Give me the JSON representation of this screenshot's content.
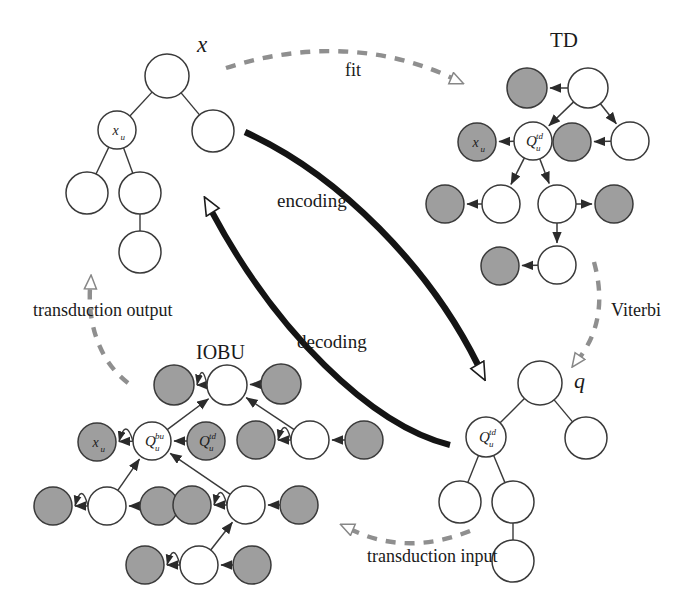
{
  "figure": {
    "background": "#ffffff",
    "ink": "#262626",
    "node_white_fill": "#ffffff",
    "node_gray_fill": "#9e9e9e",
    "node_stroke": "#3a3a3a",
    "dashed_color": "#8f8f8f",
    "thick_arrow_color": "#141414"
  },
  "labels": {
    "x_tree": "x",
    "td_title": "TD",
    "iobu_title": "IOBU",
    "q_tree": "q",
    "fit": "fit",
    "viterbi": "Viterbi",
    "encoding": "encoding",
    "decoding": "decoding",
    "transduction_output": "transduction output",
    "transduction_input": "transduction input"
  },
  "nodes": {
    "x_u": {
      "base": "x",
      "sub": "u",
      "sup": ""
    },
    "q_td": {
      "base": "Q",
      "sub": "u",
      "sup": "td"
    },
    "q_bu": {
      "base": "Q",
      "sub": "u",
      "sup": "bu"
    },
    "q_td_gray": {
      "base": "Q",
      "sub": "u",
      "sup": "td"
    },
    "q_td_tree": {
      "base": "Q",
      "sub": "u",
      "sup": "td"
    }
  },
  "trees": {
    "x": {
      "name": "input tree x",
      "nodes": [
        {
          "id": "x-root",
          "cx": 167,
          "cy": 76,
          "r": 22,
          "fill": "white",
          "label": ""
        },
        {
          "id": "x-u",
          "cx": 117,
          "cy": 130,
          "r": 19,
          "fill": "white",
          "label": "x_u"
        },
        {
          "id": "x-r",
          "cx": 213,
          "cy": 131,
          "r": 21,
          "fill": "white",
          "label": ""
        },
        {
          "id": "x-ll",
          "cx": 87,
          "cy": 193,
          "r": 21,
          "fill": "white",
          "label": ""
        },
        {
          "id": "x-lr",
          "cx": 140,
          "cy": 193,
          "r": 21,
          "fill": "white",
          "label": ""
        },
        {
          "id": "x-llr",
          "cx": 140,
          "cy": 252,
          "r": 21,
          "fill": "white",
          "label": ""
        }
      ],
      "edges": [
        [
          "x-root",
          "x-u"
        ],
        [
          "x-root",
          "x-r"
        ],
        [
          "x-u",
          "x-ll"
        ],
        [
          "x-u",
          "x-lr"
        ],
        [
          "x-lr",
          "x-llr"
        ]
      ]
    },
    "q": {
      "name": "state tree q",
      "nodes": [
        {
          "id": "q-root",
          "cx": 540,
          "cy": 383,
          "r": 22,
          "fill": "white",
          "label": ""
        },
        {
          "id": "q-u",
          "cx": 486,
          "cy": 437,
          "r": 20,
          "fill": "white",
          "label": "Q_u^td"
        },
        {
          "id": "q-r",
          "cx": 586,
          "cy": 438,
          "r": 21,
          "fill": "white",
          "label": ""
        },
        {
          "id": "q-ll",
          "cx": 460,
          "cy": 502,
          "r": 21,
          "fill": "white",
          "label": ""
        },
        {
          "id": "q-lr",
          "cx": 513,
          "cy": 502,
          "r": 21,
          "fill": "white",
          "label": ""
        },
        {
          "id": "q-llr",
          "cx": 513,
          "cy": 561,
          "r": 21,
          "fill": "white",
          "label": ""
        }
      ],
      "edges": [
        [
          "q-root",
          "q-u"
        ],
        [
          "q-root",
          "q-r"
        ],
        [
          "q-u",
          "q-ll"
        ],
        [
          "q-u",
          "q-lr"
        ],
        [
          "q-lr",
          "q-llr"
        ]
      ]
    }
  },
  "td_graph": {
    "name": "top-down hidden Markov tree model",
    "nodes": [
      {
        "id": "td-root",
        "cx": 588,
        "cy": 88,
        "r": 20,
        "fill": "white",
        "label": ""
      },
      {
        "id": "td-root-out",
        "cx": 527,
        "cy": 88,
        "r": 20,
        "fill": "gray",
        "label": ""
      },
      {
        "id": "td-qu",
        "cx": 533,
        "cy": 141,
        "r": 19,
        "fill": "white",
        "label": "Q_u^td"
      },
      {
        "id": "td-xu",
        "cx": 477,
        "cy": 142,
        "r": 19,
        "fill": "gray",
        "label": "x_u"
      },
      {
        "id": "td-r",
        "cx": 630,
        "cy": 141,
        "r": 19,
        "fill": "white",
        "label": ""
      },
      {
        "id": "td-r-out",
        "cx": 572,
        "cy": 142,
        "r": 19,
        "fill": "gray",
        "label": ""
      },
      {
        "id": "td-ll",
        "cx": 501,
        "cy": 204,
        "r": 19,
        "fill": "white",
        "label": ""
      },
      {
        "id": "td-ll-out",
        "cx": 445,
        "cy": 204,
        "r": 19,
        "fill": "gray",
        "label": ""
      },
      {
        "id": "td-lr",
        "cx": 557,
        "cy": 204,
        "r": 19,
        "fill": "white",
        "label": ""
      },
      {
        "id": "td-lr-out",
        "cx": 614,
        "cy": 204,
        "r": 19,
        "fill": "gray",
        "label": ""
      },
      {
        "id": "td-llr",
        "cx": 557,
        "cy": 265,
        "r": 19,
        "fill": "white",
        "label": ""
      },
      {
        "id": "td-llr-out",
        "cx": 500,
        "cy": 266,
        "r": 19,
        "fill": "gray",
        "label": ""
      }
    ],
    "edges": [
      {
        "from": "td-root",
        "to": "td-root-out",
        "kind": "arrow"
      },
      {
        "from": "td-root",
        "to": "td-qu",
        "kind": "arrow"
      },
      {
        "from": "td-root",
        "to": "td-r",
        "kind": "arrow"
      },
      {
        "from": "td-qu",
        "to": "td-xu",
        "kind": "arrow"
      },
      {
        "from": "td-r",
        "to": "td-r-out",
        "kind": "arrow"
      },
      {
        "from": "td-qu",
        "to": "td-ll",
        "kind": "arrow"
      },
      {
        "from": "td-qu",
        "to": "td-lr",
        "kind": "arrow"
      },
      {
        "from": "td-ll",
        "to": "td-ll-out",
        "kind": "arrow"
      },
      {
        "from": "td-lr",
        "to": "td-lr-out",
        "kind": "arrow"
      },
      {
        "from": "td-lr",
        "to": "td-llr",
        "kind": "arrow"
      },
      {
        "from": "td-llr",
        "to": "td-llr-out",
        "kind": "arrow"
      }
    ]
  },
  "iobu_graph": {
    "name": "input-output bottom-up model",
    "nodes": [
      {
        "id": "bu-root",
        "cx": 227,
        "cy": 385,
        "r": 20,
        "fill": "white",
        "label": ""
      },
      {
        "id": "bu-root-l",
        "cx": 174,
        "cy": 385,
        "r": 20,
        "fill": "gray",
        "label": ""
      },
      {
        "id": "bu-root-r",
        "cx": 281,
        "cy": 384,
        "r": 20,
        "fill": "gray",
        "label": ""
      },
      {
        "id": "bu-qbu",
        "cx": 152,
        "cy": 441,
        "r": 19,
        "fill": "white",
        "label": "Q_u^bu"
      },
      {
        "id": "bu-xu",
        "cx": 97,
        "cy": 442,
        "r": 19,
        "fill": "gray",
        "label": "x_u"
      },
      {
        "id": "bu-qtd",
        "cx": 206,
        "cy": 441,
        "r": 19,
        "fill": "gray",
        "label": "Q_u^td"
      },
      {
        "id": "bu-r",
        "cx": 310,
        "cy": 440,
        "r": 19,
        "fill": "white",
        "label": ""
      },
      {
        "id": "bu-r-l",
        "cx": 256,
        "cy": 440,
        "r": 19,
        "fill": "gray",
        "label": ""
      },
      {
        "id": "bu-r-r",
        "cx": 364,
        "cy": 440,
        "r": 19,
        "fill": "gray",
        "label": ""
      },
      {
        "id": "bu-ll",
        "cx": 107,
        "cy": 506,
        "r": 19,
        "fill": "white",
        "label": ""
      },
      {
        "id": "bu-ll-l",
        "cx": 53,
        "cy": 506,
        "r": 19,
        "fill": "gray",
        "label": ""
      },
      {
        "id": "bu-ll-r",
        "cx": 159,
        "cy": 506,
        "r": 19,
        "fill": "gray",
        "label": ""
      },
      {
        "id": "bu-lr",
        "cx": 246,
        "cy": 505,
        "r": 19,
        "fill": "white",
        "label": ""
      },
      {
        "id": "bu-lr-l",
        "cx": 192,
        "cy": 505,
        "r": 19,
        "fill": "gray",
        "label": ""
      },
      {
        "id": "bu-lr-r",
        "cx": 299,
        "cy": 505,
        "r": 19,
        "fill": "gray",
        "label": ""
      },
      {
        "id": "bu-b",
        "cx": 199,
        "cy": 565,
        "r": 19,
        "fill": "white",
        "label": ""
      },
      {
        "id": "bu-b-l",
        "cx": 145,
        "cy": 565,
        "r": 19,
        "fill": "gray",
        "label": ""
      },
      {
        "id": "bu-b-r",
        "cx": 252,
        "cy": 565,
        "r": 19,
        "fill": "gray",
        "label": ""
      }
    ],
    "edges": [
      {
        "from": "bu-root-r",
        "to": "bu-root",
        "kind": "arrow"
      },
      {
        "from": "bu-root",
        "to": "bu-root-l",
        "kind": "arrow"
      },
      {
        "from": "bu-root",
        "to": "bu-root-l",
        "kind": "curve"
      },
      {
        "from": "bu-qtd",
        "to": "bu-qbu",
        "kind": "arrow"
      },
      {
        "from": "bu-qbu",
        "to": "bu-xu",
        "kind": "arrow"
      },
      {
        "from": "bu-qbu",
        "to": "bu-xu",
        "kind": "curve"
      },
      {
        "from": "bu-qbu",
        "to": "bu-root",
        "kind": "arrow"
      },
      {
        "from": "bu-r",
        "to": "bu-root",
        "kind": "arrow"
      },
      {
        "from": "bu-r-r",
        "to": "bu-r",
        "kind": "arrow"
      },
      {
        "from": "bu-r",
        "to": "bu-r-l",
        "kind": "arrow"
      },
      {
        "from": "bu-r",
        "to": "bu-r-l",
        "kind": "curve"
      },
      {
        "from": "bu-ll",
        "to": "bu-qbu",
        "kind": "arrow"
      },
      {
        "from": "bu-lr",
        "to": "bu-qbu",
        "kind": "arrow"
      },
      {
        "from": "bu-ll-r",
        "to": "bu-ll",
        "kind": "arrow"
      },
      {
        "from": "bu-ll",
        "to": "bu-ll-l",
        "kind": "arrow"
      },
      {
        "from": "bu-ll",
        "to": "bu-ll-l",
        "kind": "curve"
      },
      {
        "from": "bu-lr-r",
        "to": "bu-lr",
        "kind": "arrow"
      },
      {
        "from": "bu-lr",
        "to": "bu-lr-l",
        "kind": "arrow"
      },
      {
        "from": "bu-lr",
        "to": "bu-lr-l",
        "kind": "curve"
      },
      {
        "from": "bu-b",
        "to": "bu-lr",
        "kind": "arrow"
      },
      {
        "from": "bu-b-r",
        "to": "bu-b",
        "kind": "arrow"
      },
      {
        "from": "bu-b",
        "to": "bu-b-l",
        "kind": "arrow"
      },
      {
        "from": "bu-b",
        "to": "bu-b-l",
        "kind": "curve"
      }
    ]
  },
  "flow_arrows": [
    {
      "id": "fit",
      "label": "fit",
      "style": "dashed",
      "label_x": 347,
      "label_y": 73
    },
    {
      "id": "viterbi",
      "label": "Viterbi",
      "style": "dashed",
      "label_x": 612,
      "label_y": 311
    },
    {
      "id": "transduction-input",
      "label": "transduction input",
      "style": "dashed",
      "label_x": 369,
      "label_y": 558
    },
    {
      "id": "transduction-output",
      "label": "transduction output",
      "style": "dashed",
      "label_x": 35,
      "label_y": 312
    },
    {
      "id": "encoding",
      "label": "encoding",
      "style": "thick",
      "label_x": 280,
      "label_y": 203
    },
    {
      "id": "decoding",
      "label": "decoding",
      "style": "thick",
      "label_x": 300,
      "label_y": 344
    }
  ]
}
